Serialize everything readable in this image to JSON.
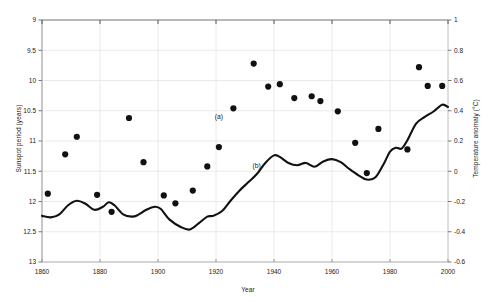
{
  "chart_data": {
    "type": "scatter",
    "title": "",
    "xlabel": "Year",
    "ylabel": "Sunspot period (years)",
    "y2label": "Temperature anomaly (°C)",
    "xlim": [
      1860,
      2000
    ],
    "ylim": [
      13,
      9
    ],
    "y2lim": [
      -0.6,
      1
    ],
    "y_inverted": true,
    "grid": true,
    "legend": "none",
    "xticks": [
      1860,
      1880,
      1900,
      1920,
      1940,
      1960,
      1980,
      2000
    ],
    "xticklabels": [
      "1860",
      "1880",
      "1900",
      "1920",
      "1940",
      "1960",
      "1980",
      "2000"
    ],
    "yticks": [
      9,
      9.5,
      10,
      10.5,
      11,
      11.5,
      12,
      12.5,
      13
    ],
    "yticklabels": [
      "9",
      "9.5",
      "10",
      "10.5",
      "11",
      "11.5",
      "12",
      "12.5",
      "13"
    ],
    "y2ticks": [
      1,
      0.8,
      0.6,
      0.4,
      0.2,
      0,
      -0.2,
      -0.4,
      -0.6
    ],
    "y2ticklabels": [
      "1",
      "0.8",
      "0.6",
      "0.4",
      "0.2",
      "0",
      "-0.2",
      "-0.4",
      "-0.6"
    ],
    "annotations": [
      {
        "text": "(a)",
        "x": 1921,
        "y_axis": "left",
        "y": 10.63,
        "describes": "sunspot period series"
      },
      {
        "text": "(b)",
        "x": 1934,
        "y_axis": "right",
        "y": 0.02,
        "describes": "temperature anomaly series"
      }
    ],
    "series": [
      {
        "name": "(a) Sunspot period",
        "type": "scatter",
        "axis": "left",
        "marker": "filled-circle",
        "color": "#111111",
        "points": [
          {
            "x": 1862,
            "y": 11.87
          },
          {
            "x": 1868,
            "y": 11.22
          },
          {
            "x": 1872,
            "y": 10.93
          },
          {
            "x": 1879,
            "y": 11.89
          },
          {
            "x": 1884,
            "y": 12.17
          },
          {
            "x": 1890,
            "y": 10.62
          },
          {
            "x": 1895,
            "y": 11.35
          },
          {
            "x": 1902,
            "y": 11.9
          },
          {
            "x": 1906,
            "y": 12.03
          },
          {
            "x": 1912,
            "y": 11.82
          },
          {
            "x": 1917,
            "y": 11.42
          },
          {
            "x": 1921,
            "y": 11.1
          },
          {
            "x": 1926,
            "y": 10.46
          },
          {
            "x": 1933,
            "y": 9.72
          },
          {
            "x": 1938,
            "y": 10.1
          },
          {
            "x": 1942,
            "y": 10.06
          },
          {
            "x": 1947,
            "y": 10.29
          },
          {
            "x": 1953,
            "y": 10.26
          },
          {
            "x": 1956,
            "y": 10.34
          },
          {
            "x": 1962,
            "y": 10.51
          },
          {
            "x": 1968,
            "y": 11.03
          },
          {
            "x": 1972,
            "y": 11.53
          },
          {
            "x": 1976,
            "y": 10.8
          },
          {
            "x": 1986,
            "y": 11.14
          },
          {
            "x": 1990,
            "y": 9.78
          },
          {
            "x": 1993,
            "y": 10.09
          },
          {
            "x": 1998,
            "y": 10.09
          }
        ]
      },
      {
        "name": "(b) Temperature anomaly",
        "type": "line",
        "axis": "right",
        "color": "#111111",
        "linewidth": 2.1,
        "points": [
          {
            "x": 1860,
            "y": -0.295
          },
          {
            "x": 1863,
            "y": -0.305
          },
          {
            "x": 1866,
            "y": -0.285
          },
          {
            "x": 1869,
            "y": -0.225
          },
          {
            "x": 1872,
            "y": -0.195
          },
          {
            "x": 1875,
            "y": -0.215
          },
          {
            "x": 1878,
            "y": -0.255
          },
          {
            "x": 1881,
            "y": -0.235
          },
          {
            "x": 1883,
            "y": -0.205
          },
          {
            "x": 1885,
            "y": -0.225
          },
          {
            "x": 1888,
            "y": -0.285
          },
          {
            "x": 1891,
            "y": -0.3
          },
          {
            "x": 1893,
            "y": -0.29
          },
          {
            "x": 1896,
            "y": -0.255
          },
          {
            "x": 1899,
            "y": -0.235
          },
          {
            "x": 1901,
            "y": -0.25
          },
          {
            "x": 1904,
            "y": -0.32
          },
          {
            "x": 1908,
            "y": -0.37
          },
          {
            "x": 1911,
            "y": -0.385
          },
          {
            "x": 1914,
            "y": -0.345
          },
          {
            "x": 1917,
            "y": -0.3
          },
          {
            "x": 1919,
            "y": -0.295
          },
          {
            "x": 1922,
            "y": -0.265
          },
          {
            "x": 1925,
            "y": -0.195
          },
          {
            "x": 1928,
            "y": -0.13
          },
          {
            "x": 1931,
            "y": -0.075
          },
          {
            "x": 1934,
            "y": -0.02
          },
          {
            "x": 1937,
            "y": 0.055
          },
          {
            "x": 1940,
            "y": 0.105
          },
          {
            "x": 1942,
            "y": 0.095
          },
          {
            "x": 1945,
            "y": 0.055
          },
          {
            "x": 1948,
            "y": 0.04
          },
          {
            "x": 1951,
            "y": 0.055
          },
          {
            "x": 1954,
            "y": 0.03
          },
          {
            "x": 1957,
            "y": 0.065
          },
          {
            "x": 1960,
            "y": 0.08
          },
          {
            "x": 1963,
            "y": 0.06
          },
          {
            "x": 1966,
            "y": 0.015
          },
          {
            "x": 1969,
            "y": -0.025
          },
          {
            "x": 1972,
            "y": -0.055
          },
          {
            "x": 1975,
            "y": -0.04
          },
          {
            "x": 1978,
            "y": 0.055
          },
          {
            "x": 1980,
            "y": 0.13
          },
          {
            "x": 1982,
            "y": 0.155
          },
          {
            "x": 1984,
            "y": 0.15
          },
          {
            "x": 1986,
            "y": 0.205
          },
          {
            "x": 1989,
            "y": 0.315
          },
          {
            "x": 1992,
            "y": 0.36
          },
          {
            "x": 1995,
            "y": 0.395
          },
          {
            "x": 1998,
            "y": 0.44
          },
          {
            "x": 2000,
            "y": 0.425
          }
        ]
      }
    ]
  }
}
